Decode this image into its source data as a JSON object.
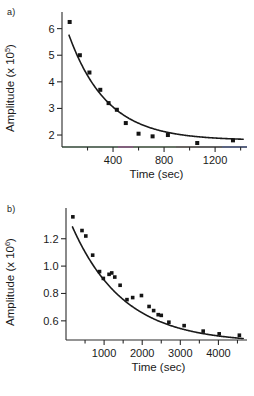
{
  "figure": {
    "background": "#ffffff",
    "ink": "#1a1a1a",
    "panels": [
      {
        "id": "a",
        "label": "a)",
        "xlabel": "Time (sec)",
        "ylabel_main": "Amplitude (x 10",
        "ylabel_exp": "5",
        "ylabel_close": ")"
      },
      {
        "id": "b",
        "label": "b)",
        "xlabel": "Time (sec)",
        "ylabel_main": "Amplitude (x 10",
        "ylabel_exp": "6",
        "ylabel_close": ")"
      }
    ]
  },
  "chart_data": [
    {
      "type": "scatter",
      "id": "panel-a",
      "title": "a)",
      "xlabel": "Time (sec)",
      "ylabel": "Amplitude (x 10^5)",
      "xlim": [
        0,
        1450
      ],
      "ylim": [
        1.55,
        6.55
      ],
      "xticks": [
        400,
        800,
        1200
      ],
      "xticklabels": [
        "400",
        "800",
        "1200"
      ],
      "xticks_minor": [
        200,
        600,
        1000,
        1400
      ],
      "yticks": [
        2,
        3,
        4,
        5,
        6
      ],
      "yticklabels": [
        "2",
        "3",
        "4",
        "5",
        "6"
      ],
      "grid": false,
      "legend": false,
      "series": [
        {
          "name": "amplitude decay",
          "marker": "filled-square",
          "x": [
            60,
            140,
            215,
            300,
            365,
            430,
            500,
            600,
            710,
            830,
            1060,
            1340
          ],
          "y": [
            6.25,
            5.0,
            4.35,
            3.7,
            3.2,
            2.95,
            2.45,
            2.05,
            1.95,
            2.0,
            1.7,
            1.8
          ]
        }
      ],
      "fit": {
        "name": "single exponential fit",
        "model": "y = y0 + A*exp(-x/tau)",
        "y0": 1.8,
        "A": 4.75,
        "tau": 300,
        "x_start": 55,
        "x_end": 1420
      }
    },
    {
      "type": "scatter",
      "id": "panel-b",
      "title": "b)",
      "xlabel": "Time (sec)",
      "ylabel": "Amplitude (x 10^6)",
      "xlim": [
        0,
        4750
      ],
      "ylim": [
        0.46,
        1.41
      ],
      "xticks": [
        1000,
        2000,
        3000,
        4000
      ],
      "xticklabels": [
        "1000",
        "2000",
        "3000",
        "4000"
      ],
      "xticks_minor": [
        500,
        1500,
        2500,
        3500,
        4500
      ],
      "yticks": [
        0.6,
        0.8,
        1.0,
        1.2
      ],
      "yticklabels": [
        "0.6",
        "0.8",
        "1.0",
        "1.2"
      ],
      "grid": false,
      "legend": false,
      "series": [
        {
          "name": "amplitude decay",
          "marker": "filled-square",
          "x": [
            180,
            420,
            520,
            700,
            880,
            980,
            1130,
            1200,
            1280,
            1420,
            1600,
            1750,
            1980,
            2180,
            2300,
            2420,
            2500,
            2700,
            3100,
            3600,
            4020,
            4550
          ],
          "y": [
            1.36,
            1.26,
            1.22,
            1.08,
            0.96,
            0.91,
            0.94,
            0.95,
            0.92,
            0.86,
            0.755,
            0.77,
            0.785,
            0.705,
            0.675,
            0.645,
            0.64,
            0.59,
            0.565,
            0.525,
            0.505,
            0.495
          ]
        }
      ],
      "fit": {
        "name": "single exponential fit",
        "model": "y = y0 + A*exp(-x/tau)",
        "y0": 0.44,
        "A": 0.96,
        "tau": 1350,
        "x_start": 170,
        "x_end": 4650
      }
    }
  ]
}
